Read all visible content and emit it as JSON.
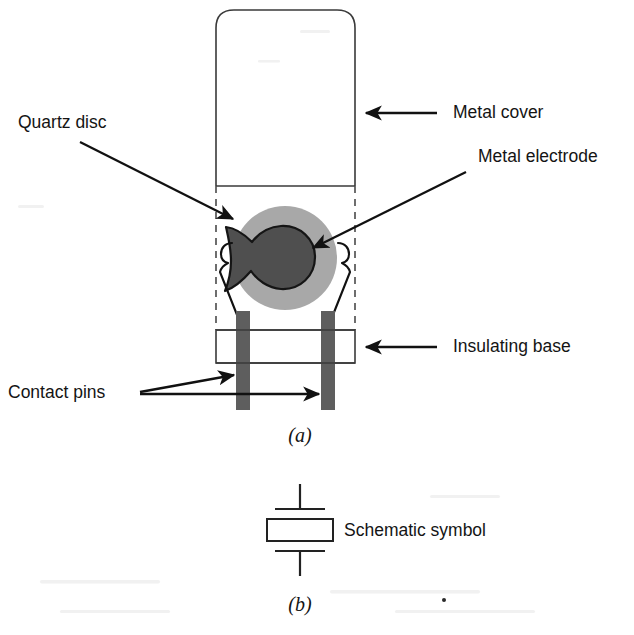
{
  "figure": {
    "captions": [
      {
        "id": "caption-a",
        "text": "(a)"
      },
      {
        "id": "caption-b",
        "text": "(b)"
      }
    ]
  },
  "labels": {
    "quartz_disc": "Quartz disc",
    "metal_cover": "Metal cover",
    "metal_electrode": "Metal electrode",
    "insulating_base": "Insulating base",
    "contact_pins": "Contact pins",
    "schematic_symbol": "Schematic symbol"
  },
  "colors": {
    "quartz_disc_fill": "#a8a8a8",
    "metal_electrode_fill": "#4f4f4f",
    "contact_pin_fill": "#5e5e5e",
    "outline": "#3a3a3a",
    "leader_line": "#111111",
    "text": "#141414",
    "background": "#ffffff"
  },
  "parts": [
    {
      "name": "metal-cover",
      "label": "Metal cover",
      "shape": "rounded-rectangle-can"
    },
    {
      "name": "quartz-disc",
      "label": "Quartz disc",
      "shape": "circle"
    },
    {
      "name": "metal-electrode",
      "label": "Metal electrode",
      "shape": "irregular-blob"
    },
    {
      "name": "insulating-base",
      "label": "Insulating base",
      "shape": "rectangle"
    },
    {
      "name": "contact-pins",
      "label": "Contact pins",
      "shape": "two-vertical-bars",
      "count": 2
    },
    {
      "name": "mounting-clips",
      "label": "",
      "shape": "two-spring-hooks",
      "count": 2
    }
  ],
  "schematic": {
    "symbol_label": "Schematic symbol",
    "symbol_type": "crystal-resonator",
    "elements": [
      "top-lead",
      "top-plate",
      "body-rectangle",
      "bottom-plate",
      "bottom-lead"
    ]
  }
}
